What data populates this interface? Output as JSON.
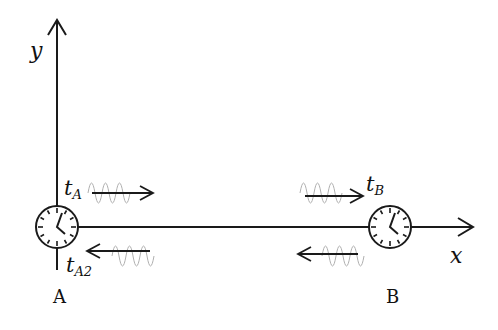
{
  "diagram": {
    "axes": {
      "y_label": "y",
      "x_label": "x"
    },
    "clock_a": {
      "label": "A",
      "time_emit": "t",
      "time_emit_sub": "A",
      "time_return": "t",
      "time_return_sub": "A2"
    },
    "clock_b": {
      "label": "B",
      "time_receive": "t",
      "time_receive_sub": "B"
    },
    "signals": [
      {
        "direction": "A-to-B",
        "from": "A",
        "to": "B"
      },
      {
        "direction": "B-to-A",
        "from": "B",
        "to": "A"
      }
    ],
    "colors": {
      "line": "#1a1a1a",
      "wave": "#b0b0b0"
    }
  }
}
